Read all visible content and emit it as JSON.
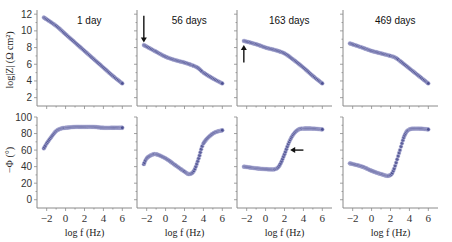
{
  "chart_data": {
    "type": "scatter",
    "colors": {
      "marker_fill": "#4b4f91",
      "marker_edge": "#c9c9e6",
      "axis": "#8a8a8a",
      "arrow": "#111111"
    },
    "shared": {
      "xlabel": "log f (Hz)",
      "x_ticks": [
        "−2",
        "0",
        "2",
        "4",
        "6"
      ],
      "x_tick_values": [
        -2,
        0,
        2,
        4,
        6
      ],
      "xlim": [
        -2.6,
        6.6
      ],
      "top_ylabel": "log|Z| (Ω cm²)",
      "top_ylim": [
        1,
        12.5
      ],
      "top_y_ticks": [
        2,
        4,
        6,
        8,
        10,
        12
      ],
      "bottom_ylabel": "−Φ (°)",
      "bottom_ylim": [
        -10,
        100
      ],
      "bottom_y_ticks": [
        0,
        20,
        40,
        60,
        80,
        100
      ]
    },
    "panels": [
      {
        "title": "1 day",
        "modulus": {
          "x": [
            -2.3,
            -1,
            0,
            1,
            2,
            3,
            4,
            5,
            6
          ],
          "y": [
            11.6,
            10.6,
            9.6,
            8.6,
            7.6,
            6.6,
            5.6,
            4.6,
            3.7
          ]
        },
        "phase": {
          "x": [
            -2.3,
            -2,
            -1.5,
            -1,
            -0.5,
            0,
            1,
            2,
            3,
            4,
            5,
            6
          ],
          "y": [
            62,
            68,
            76,
            83,
            86,
            87,
            88,
            88,
            88,
            87,
            87,
            87
          ]
        },
        "arrows": []
      },
      {
        "title": "56 days",
        "modulus": {
          "x": [
            -2.3,
            -1,
            0,
            1,
            2,
            3,
            3.5,
            4,
            5,
            6
          ],
          "y": [
            8.3,
            7.5,
            6.9,
            6.5,
            6.2,
            5.8,
            5.5,
            5.0,
            4.3,
            3.7
          ]
        },
        "phase": {
          "x": [
            -2.3,
            -2,
            -1.5,
            -1,
            0,
            1,
            2,
            2.5,
            3,
            3.5,
            4,
            5,
            6
          ],
          "y": [
            43,
            50,
            54,
            55,
            50,
            42,
            34,
            31,
            35,
            50,
            68,
            80,
            84
          ]
        },
        "arrows": [
          {
            "panel_row": "modulus",
            "direction": "down",
            "x": -2.3,
            "y_start": 11.8,
            "y_end": 8.6
          }
        ]
      },
      {
        "title": "163 days",
        "modulus": {
          "x": [
            -2.3,
            -1,
            0,
            1,
            2,
            3,
            4,
            5,
            6
          ],
          "y": [
            8.8,
            8.4,
            8.0,
            7.7,
            7.3,
            6.5,
            5.6,
            4.6,
            3.7
          ]
        },
        "phase": {
          "x": [
            -2.3,
            -1,
            0,
            1,
            1.5,
            2,
            2.5,
            3,
            3.5,
            4,
            5,
            6
          ],
          "y": [
            40,
            38,
            37,
            37,
            42,
            55,
            70,
            80,
            85,
            86,
            86,
            85
          ]
        },
        "arrows": [
          {
            "panel_row": "modulus",
            "direction": "up",
            "x": -2.3,
            "y_start": 6.2,
            "y_end": 8.3
          },
          {
            "panel_row": "phase",
            "direction": "left",
            "x_start": 4.0,
            "x_end": 2.6,
            "y": 60
          }
        ]
      },
      {
        "title": "469 days",
        "modulus": {
          "x": [
            -2.3,
            -1,
            0,
            1,
            2,
            2.5,
            3,
            4,
            5,
            6
          ],
          "y": [
            8.5,
            8.0,
            7.6,
            7.3,
            7.0,
            6.8,
            6.4,
            5.5,
            4.6,
            3.7
          ]
        },
        "phase": {
          "x": [
            -2.3,
            -1,
            0,
            1,
            1.8,
            2.3,
            3,
            3.5,
            4,
            5,
            6
          ],
          "y": [
            44,
            40,
            35,
            31,
            29,
            35,
            60,
            78,
            85,
            86,
            85
          ]
        },
        "arrows": []
      }
    ]
  }
}
